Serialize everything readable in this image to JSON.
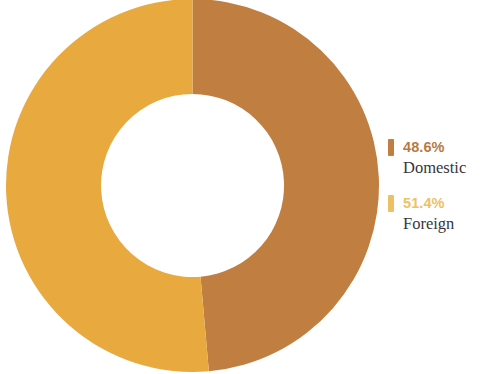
{
  "chart_data": {
    "type": "pie",
    "variant": "donut",
    "title": "",
    "subtitle": "",
    "xlabel": "",
    "ylabel": "",
    "grid": false,
    "legend_position": "right",
    "units": "%",
    "start_angle_deg": 0,
    "direction": "clockwise",
    "inner_radius_ratio": 0.5,
    "categories": [
      "Domestic",
      "Foreign"
    ],
    "values": [
      48.6,
      51.4
    ],
    "labels": [
      "48.6%",
      "51.4%"
    ],
    "colors": [
      "#c07f41",
      "#e8a93f"
    ],
    "slices": [
      {
        "name": "Domestic",
        "value": 48.6,
        "label": "48.6%",
        "color": "#c07f41",
        "side": "right"
      },
      {
        "name": "Foreign",
        "value": 51.4,
        "label": "51.4%",
        "color": "#e8a93f",
        "side": "left"
      }
    ]
  },
  "legend": {
    "entries": [
      {
        "percent": "48.6%",
        "name": "Domestic",
        "color": "#c07f41",
        "text_color": "#b87a43"
      },
      {
        "percent": "51.4%",
        "name": "Foreign",
        "color": "#edc063",
        "text_color": "#eec163"
      }
    ]
  },
  "colors": {
    "domestic": "#c07f41",
    "foreign": "#e8a93f",
    "background": "#ffffff",
    "label_text": "#38363a"
  }
}
